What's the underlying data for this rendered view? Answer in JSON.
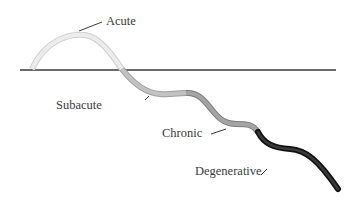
{
  "diagram": {
    "type": "disease-progression-curve",
    "baseline": {
      "color": "#3a3a3a"
    },
    "stages": [
      {
        "id": "acute",
        "label": "Acute",
        "color": "#e4e4e4",
        "edge": "#cfcfcf"
      },
      {
        "id": "subacute",
        "label": "Subacute",
        "color": "#b9b9b9",
        "edge": "#9a9a9a"
      },
      {
        "id": "chronic",
        "label": "Chronic",
        "color": "#9a9a9a",
        "edge": "#7a7a7a"
      },
      {
        "id": "degenerative",
        "label": "Degenerative",
        "color": "#2a2a2a",
        "edge": "#111111"
      }
    ]
  }
}
